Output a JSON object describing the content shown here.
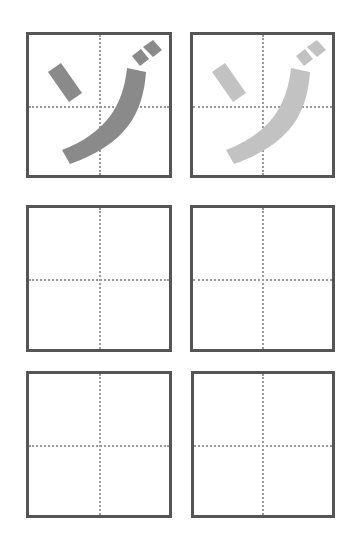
{
  "sheet": {
    "title": "",
    "character": "ゾ",
    "colors": {
      "border": "#555555",
      "guide": "#9a9a9a",
      "model_glyph": "#8a8a8a",
      "trace_glyph": "#c2c2c2",
      "background": "#ffffff"
    },
    "rows": [
      {
        "boxes": [
          {
            "type": "model",
            "glyph": "ゾ",
            "shade": "dark"
          },
          {
            "type": "trace",
            "glyph": "ゾ",
            "shade": "light"
          }
        ]
      },
      {
        "boxes": [
          {
            "type": "blank",
            "glyph": ""
          },
          {
            "type": "blank",
            "glyph": ""
          }
        ]
      },
      {
        "boxes": [
          {
            "type": "blank",
            "glyph": ""
          },
          {
            "type": "blank",
            "glyph": ""
          }
        ]
      }
    ]
  }
}
